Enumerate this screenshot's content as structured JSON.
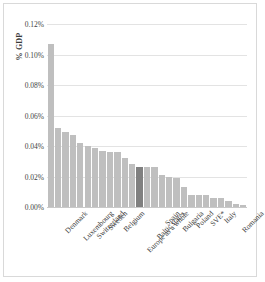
{
  "chart_data": {
    "type": "bar",
    "title": "",
    "xlabel": "",
    "ylabel": "% GDP",
    "ylim": [
      0,
      0.0012
    ],
    "grid": true,
    "legend": "none",
    "units": "percent of GDP",
    "ytick_labels": [
      "0.12%",
      "0.10%",
      "0.08%",
      "0.06%",
      "0.04%",
      "0.02%",
      "0.00%"
    ],
    "ytick_values": [
      0.12,
      0.1,
      0.08,
      0.06,
      0.04,
      0.02,
      0.0
    ],
    "highlight_category": "Baltic states",
    "highlight_color": "#808080",
    "bar_color": "#bfbfbf",
    "categories": [
      "Denmark",
      "",
      "Luxembourg",
      "",
      "Switzerland",
      "",
      "Sweden",
      "",
      "Belgium",
      "",
      "Europe as a whole",
      "",
      "Baltic states",
      "",
      "Spain",
      "",
      "Bulgaria",
      "",
      "Poland",
      "",
      "SVE*",
      "",
      "Italy",
      "",
      "Romania",
      "",
      ""
    ],
    "labeled_categories": [
      "Denmark",
      "Luxembourg",
      "Switzerland",
      "Sweden",
      "Belgium",
      "Europe as a whole",
      "Baltic states",
      "Spain",
      "Bulgaria",
      "Poland",
      "SVE*",
      "Italy",
      "Romania"
    ],
    "values": [
      0.107,
      0.052,
      0.049,
      0.047,
      0.042,
      0.04,
      0.039,
      0.037,
      0.036,
      0.036,
      0.032,
      0.028,
      0.026,
      0.026,
      0.026,
      0.021,
      0.02,
      0.019,
      0.013,
      0.008,
      0.008,
      0.008,
      0.006,
      0.006,
      0.004,
      0.002,
      0.001
    ]
  }
}
